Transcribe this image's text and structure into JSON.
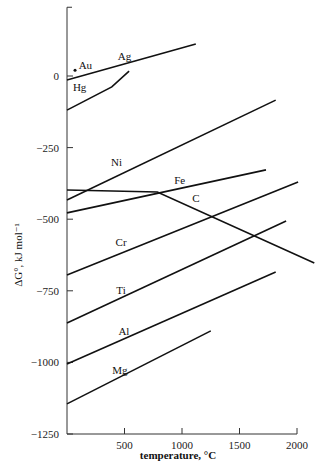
{
  "chart_data": {
    "type": "line",
    "title": "",
    "xlabel": "temperature, °C",
    "ylabel": "ΔG°, kJ mol⁻¹",
    "xlim": [
      0,
      2100
    ],
    "ylim": [
      -1250,
      240
    ],
    "x_ticks": [
      500,
      1000,
      1500,
      2000
    ],
    "y_ticks": [
      0,
      -250,
      -500,
      -750,
      -1000,
      -1250
    ],
    "x_tick_labels": [
      "500",
      "1000",
      "1500",
      "2000"
    ],
    "y_tick_labels": [
      "0",
      "−250",
      "−500",
      "−750",
      "−1000",
      "−1250"
    ],
    "grid": false,
    "legend": "inline labels",
    "series": [
      {
        "name": "Ag",
        "points": [
          [
            0,
            -14
          ],
          [
            1120,
            112
          ]
        ],
        "label_at": [
          500,
          57
        ]
      },
      {
        "name": "Hg",
        "points": [
          [
            0,
            -119
          ],
          [
            390,
            -38
          ],
          [
            540,
            17
          ]
        ],
        "label_at": [
          110,
          -52
        ]
      },
      {
        "name": "Ni",
        "points": [
          [
            0,
            -433
          ],
          [
            1815,
            -84
          ]
        ],
        "label_at": [
          430,
          -314
        ]
      },
      {
        "name": "C",
        "points": [
          [
            0,
            -398
          ],
          [
            785,
            -405
          ],
          [
            2150,
            -653
          ]
        ],
        "label_at": [
          1120,
          -440
        ]
      },
      {
        "name": "Fe",
        "points": [
          [
            0,
            -478
          ],
          [
            1730,
            -328
          ]
        ],
        "label_at": [
          980,
          -376
        ]
      },
      {
        "name": "Cr",
        "points": [
          [
            0,
            -695
          ],
          [
            2010,
            -370
          ]
        ],
        "label_at": [
          470,
          -595
        ]
      },
      {
        "name": "Ti",
        "points": [
          [
            0,
            -862
          ],
          [
            1905,
            -506
          ]
        ],
        "label_at": [
          470,
          -760
        ]
      },
      {
        "name": "Al",
        "points": [
          [
            0,
            -1006
          ],
          [
            1815,
            -684
          ]
        ],
        "label_at": [
          495,
          -905
        ]
      },
      {
        "name": "Mg",
        "points": [
          [
            0,
            -1145
          ],
          [
            1250,
            -890
          ]
        ],
        "label_at": [
          460,
          -1040
        ]
      }
    ],
    "points": [
      {
        "name": "Au",
        "x": 70,
        "y": 20,
        "label_at": [
          160,
          23
        ]
      }
    ]
  }
}
